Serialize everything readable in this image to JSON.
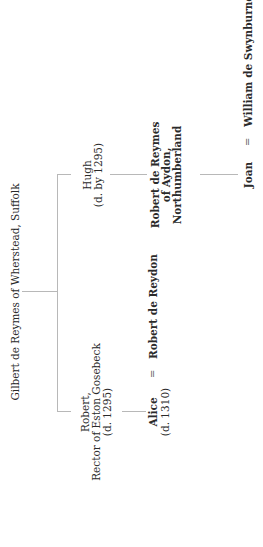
{
  "diagram": {
    "type": "family-tree",
    "orientation": "rotated-90-ccw",
    "root": {
      "name": "Gilbert de Reymes of Wherstead, Suffolk"
    },
    "children": [
      {
        "name": "Robert,",
        "line2": "Rector of Eston Gosebeck",
        "dates": "(d. 1295)",
        "child": {
          "name": "Alice",
          "dates": "(d. 1310)",
          "spouse_sign": "=",
          "spouse": "Robert de Reydon"
        }
      },
      {
        "name": "Hugh",
        "dates": "(d.  by 1295)",
        "child": {
          "line1": "Robert de Reymes",
          "line2": "of Aydon,",
          "line3": "Northumberland",
          "child": {
            "name": "Joan",
            "spouse_sign": "=",
            "spouse": "William de Swynburne"
          }
        }
      }
    ]
  }
}
